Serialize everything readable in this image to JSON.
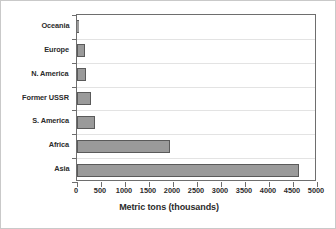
{
  "chart_data": {
    "type": "bar",
    "orientation": "horizontal",
    "title": "",
    "xlabel": "Metric tons (thousands)",
    "ylabel": "",
    "categories": [
      "Oceania",
      "Europe",
      "N. America",
      "Former USSR",
      "S. America",
      "Africa",
      "Asia"
    ],
    "values": [
      25,
      165,
      190,
      290,
      370,
      1930,
      4620
    ],
    "xlim": [
      0,
      5000
    ],
    "xticks": [
      0,
      500,
      1000,
      1500,
      2000,
      2500,
      3000,
      3500,
      4000,
      4500,
      5000
    ],
    "xticklabels": [
      "0",
      "500",
      "1000",
      "1500",
      "2000",
      "2500",
      "3000",
      "3500",
      "4000",
      "4500",
      "5000"
    ],
    "grid": "horizontal",
    "legend": null,
    "bar_color": "#9a9a9a",
    "bar_edge_color": "#5a5a5a",
    "axis_color": "#6e6e6e",
    "grid_color": "#e3e3e3",
    "text_color": "#2b2b2b",
    "background": "#ffffff"
  }
}
